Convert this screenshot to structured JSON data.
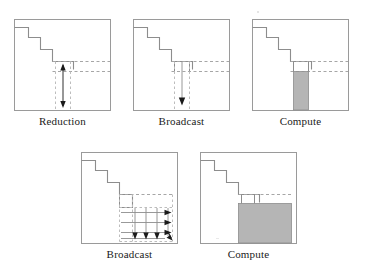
{
  "figure": {
    "background_color": "#ffffff",
    "border_color": "#9a9a9a",
    "line_color": "#8d8d8d",
    "dash_color": "#a6a6a6",
    "arrow_color": "#1a1a1a",
    "fill_color": "#b5b5b5",
    "fill_stroke_color": "#8d8d8d",
    "caption_color": "#1a1a1a",
    "rows": [
      {
        "name": "unblocked-row",
        "panels": [
          {
            "id": "panel-reduction",
            "caption": "Reduction",
            "icon": "matrix-panel-reduction",
            "description": "Square matrix outline with descending staircase; dashed guide lines mark a narrow column; a double-headed vertical arrow spans the column downward.",
            "arrows": [
              "up-arrow-head",
              "down-arrow-head"
            ],
            "arrow_count": 1,
            "shaded": false
          },
          {
            "id": "panel-broadcast-top",
            "caption": "Broadcast",
            "icon": "matrix-panel-broadcast",
            "description": "Square matrix outline with staircase; a single vertical arrow points down inside the dashed column.",
            "arrows": [
              "down-arrow-head"
            ],
            "arrow_count": 1,
            "shaded": false
          },
          {
            "id": "panel-compute-top",
            "caption": "Compute",
            "icon": "matrix-panel-compute",
            "description": "Square matrix outline with staircase; the narrow column below the current block is filled solid gray.",
            "arrows": [],
            "arrow_count": 0,
            "shaded": true,
            "shade_shape": "narrow-column"
          }
        ]
      },
      {
        "name": "blocked-row",
        "panels": [
          {
            "id": "panel-broadcast-bottom",
            "caption": "Broadcast",
            "icon": "matrix-panel-broadcast-grid",
            "description": "Square matrix outline with staircase; a grid of dashed guides with three right-pointing arrows on the rows and four down-pointing arrows on the columns, plus a corner arrow.",
            "arrows": [
              "right-arrow-head",
              "right-arrow-head",
              "right-arrow-head",
              "down-arrow-head",
              "down-arrow-head",
              "down-arrow-head",
              "corner-arrow-head"
            ],
            "arrow_count": 7,
            "row_arrows": 3,
            "column_arrows": 4,
            "shaded": false
          },
          {
            "id": "panel-compute-bottom",
            "caption": "Compute",
            "icon": "matrix-panel-compute-block",
            "description": "Square matrix outline with staircase; the trailing submatrix block at lower right is filled solid gray.",
            "arrows": [],
            "arrow_count": 0,
            "shaded": true,
            "shade_shape": "trailing-block"
          }
        ]
      }
    ]
  }
}
